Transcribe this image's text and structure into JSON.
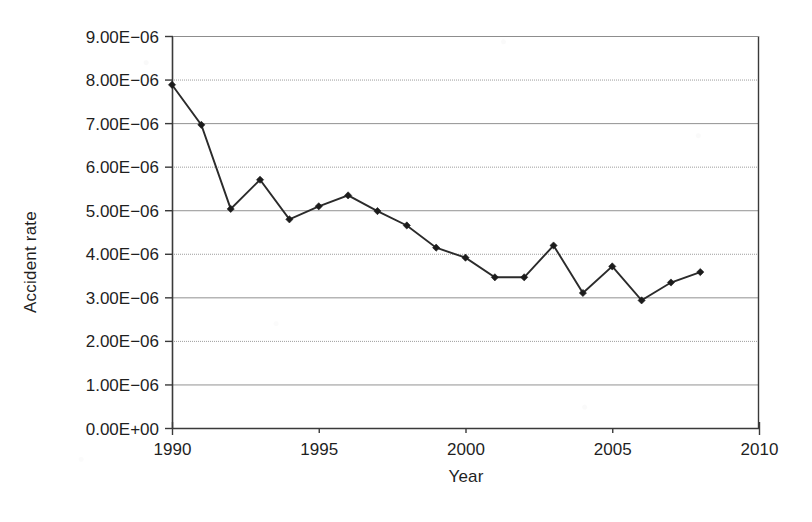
{
  "chart_data": {
    "type": "line",
    "title": "",
    "subtitle": "",
    "xlabel": "Year",
    "ylabel": "Accident rate",
    "xlim": [
      1990,
      2010
    ],
    "ylim": [
      0,
      9e-06
    ],
    "grid": true,
    "legend": null,
    "legend_position": "none",
    "marker": "diamond",
    "x_tick_labels": [
      "1990",
      "1995",
      "2000",
      "2005",
      "2010"
    ],
    "x_ticks": [
      1990,
      1995,
      2000,
      2005,
      2010
    ],
    "y_tick_labels": [
      "9.00E−06",
      "8.00E−06",
      "7.00E−06",
      "6.00E−06",
      "5.00E−06",
      "4.00E−06",
      "3.00E−06",
      "2.00E−06",
      "1.00E−06",
      "0.00E+00"
    ],
    "y_ticks": [
      9e-06,
      8e-06,
      7e-06,
      6e-06,
      5e-06,
      4e-06,
      3e-06,
      2e-06,
      1e-06,
      0
    ],
    "x": [
      1990,
      1991,
      1992,
      1993,
      1994,
      1995,
      1996,
      1997,
      1998,
      1999,
      2000,
      2001,
      2002,
      2003,
      2004,
      2005,
      2006,
      2007,
      2008
    ],
    "series": [
      {
        "name": "Accident rate",
        "color": "#2b2b2b",
        "values": [
          7.88e-06,
          6.96e-06,
          5.03e-06,
          5.7e-06,
          4.79e-06,
          5.09e-06,
          5.34e-06,
          4.98e-06,
          4.65e-06,
          4.14e-06,
          3.91e-06,
          3.46e-06,
          3.46e-06,
          4.19e-06,
          3.1e-06,
          3.71e-06,
          2.93e-06,
          3.34e-06,
          3.58e-06
        ]
      }
    ],
    "annotations": []
  },
  "style": {
    "axis_color": "#3a3a3a",
    "grid_color": "#8d8d8d",
    "line_color": "#2b2b2b",
    "marker_color": "#1c1c1c",
    "background": "#ffffff"
  },
  "geometry": {
    "plot_left": 172,
    "plot_right": 759,
    "plot_top": 36,
    "plot_bottom": 428
  }
}
